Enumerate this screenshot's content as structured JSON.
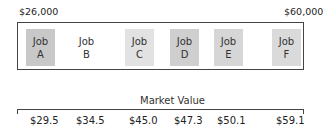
{
  "range": {
    "min_label": "$26,000",
    "max_label": "$60,000"
  },
  "jobs": [
    {
      "line1": "Job",
      "line2": "A",
      "shade": "#c8c8c8"
    },
    {
      "line1": "Job",
      "line2": "B",
      "shade": "#ffffff"
    },
    {
      "line1": "Job",
      "line2": "C",
      "shade": "#e2e2e2"
    },
    {
      "line1": "Job",
      "line2": "D",
      "shade": "#cfcfcf"
    },
    {
      "line1": "Job",
      "line2": "E",
      "shade": "#d6d6d6"
    },
    {
      "line1": "Job",
      "line2": "F",
      "shade": "#dadada"
    }
  ],
  "axis_title": "Market Value",
  "market_values": [
    "$29.5",
    "$34.5",
    "$45.0",
    "$47.3",
    "$50.1",
    "$59.1"
  ]
}
